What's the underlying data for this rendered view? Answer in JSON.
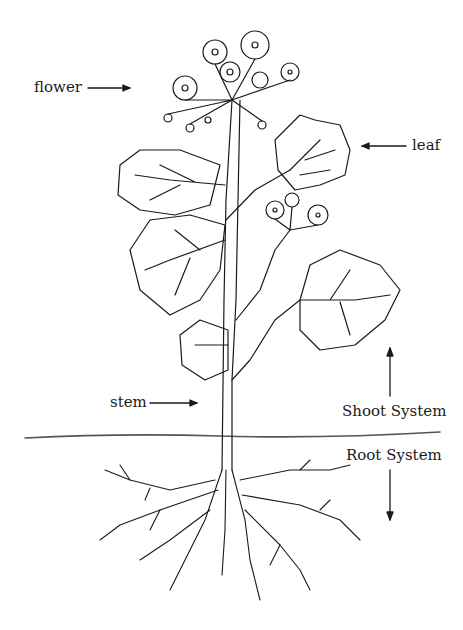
{
  "diagram": {
    "labels": {
      "flower": "flower",
      "leaf": "leaf",
      "stem": "stem",
      "shoot_system": "Shoot System",
      "root_system": "Root System"
    },
    "colors": {
      "line": "#1a1a1a",
      "ground": "#555555",
      "background": "#ffffff"
    }
  }
}
